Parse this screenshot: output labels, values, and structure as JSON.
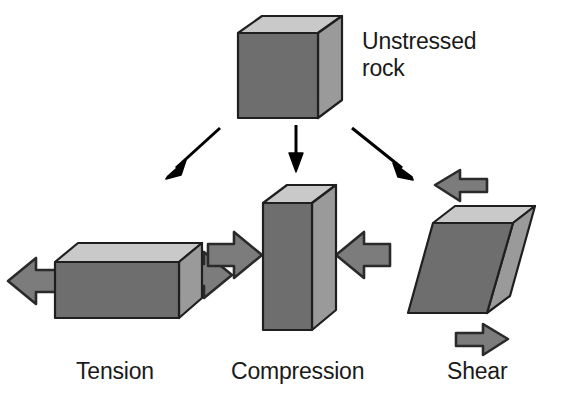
{
  "figure": {
    "background": "#ffffff"
  },
  "colors": {
    "face_front": "#6e6e6e",
    "face_top": "#c9c9c9",
    "face_side": "#9a9a9a",
    "outline": "#1f1f1f",
    "block_arrow_fill": "#7c7c7c",
    "block_arrow_outline": "#2a2a2a",
    "connector_arrow": "#000000",
    "text": "#1a1a1a"
  },
  "labels": {
    "unstressed_line1": "Unstressed",
    "unstressed_line2": "rock",
    "tension": "Tension",
    "compression": "Compression",
    "shear": "Shear"
  },
  "nodes": [
    {
      "id": "unstressed-rock",
      "label": "Unstressed rock",
      "shape": "cube",
      "description": "Undeformed cubic block of rock with no stress applied"
    },
    {
      "id": "tension-block",
      "label": "Tension",
      "shape": "elongated-box",
      "description": "Block stretched horizontally by two outward-pointing arrows",
      "arrows": [
        "left-outward",
        "right-outward"
      ]
    },
    {
      "id": "compression-block",
      "label": "Compression",
      "shape": "tall-narrow-box",
      "description": "Block squeezed by two inward-pointing arrows",
      "arrows": [
        "left-inward",
        "right-inward"
      ]
    },
    {
      "id": "shear-block",
      "label": "Shear",
      "shape": "skewed-box",
      "description": "Block deformed by opposing offset arrows, top to the left and bottom to the right",
      "arrows": [
        "top-leftward",
        "bottom-rightward"
      ]
    }
  ],
  "connectors": [
    {
      "from": "unstressed-rock",
      "to": "tension-block",
      "direction": "diagonal-down-left"
    },
    {
      "from": "unstressed-rock",
      "to": "compression-block",
      "direction": "straight-down"
    },
    {
      "from": "unstressed-rock",
      "to": "shear-block",
      "direction": "diagonal-down-right"
    }
  ]
}
